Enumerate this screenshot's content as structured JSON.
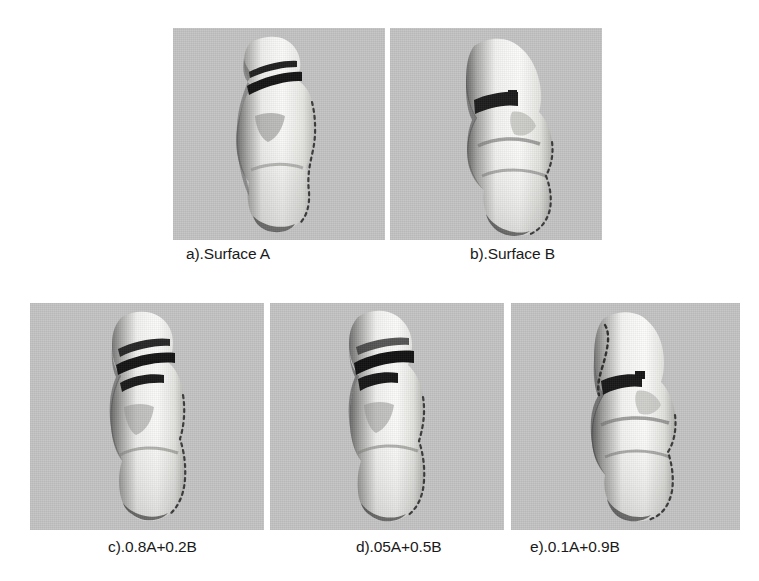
{
  "figure": {
    "background_color": "#ffffff",
    "panel_background_color": "#c4c4c4",
    "surface_light_color": "#f7f7f5",
    "surface_shadow_color": "#2a2a2a",
    "caption_color": "#1a1a1a",
    "rows": [
      {
        "name": "top-row",
        "panels": [
          {
            "id": "a",
            "caption": "a).Surface A",
            "subject": "3d-torso-surface",
            "x": 173,
            "y": 28,
            "w": 212,
            "h": 212,
            "caption_x": 186,
            "caption_y": 245
          },
          {
            "id": "b",
            "caption": "b).Surface B",
            "subject": "3d-torso-surface",
            "x": 390,
            "y": 28,
            "w": 212,
            "h": 212,
            "caption_x": 470,
            "caption_y": 245
          }
        ]
      },
      {
        "name": "bottom-row",
        "panels": [
          {
            "id": "c",
            "caption": "c).0.8A+0.2B",
            "subject": "3d-torso-surface",
            "x": 30,
            "y": 303,
            "w": 234,
            "h": 227,
            "caption_x": 108,
            "caption_y": 538
          },
          {
            "id": "d",
            "caption": "d).05A+0.5B",
            "subject": "3d-torso-surface",
            "x": 270,
            "y": 303,
            "w": 234,
            "h": 227,
            "caption_x": 356,
            "caption_y": 538
          },
          {
            "id": "e",
            "caption": "e).0.1A+0.9B",
            "subject": "3d-torso-surface",
            "x": 511,
            "y": 303,
            "w": 229,
            "h": 227,
            "caption_x": 530,
            "caption_y": 538
          }
        ]
      }
    ]
  }
}
